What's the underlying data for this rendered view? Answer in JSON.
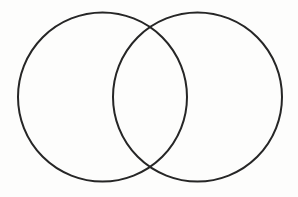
{
  "figure": {
    "kind": "venn-diagram",
    "caption": "",
    "background_color": "#fdfdfc",
    "canvas": {
      "width": 298,
      "height": 197
    },
    "stroke": {
      "color": "#262626",
      "width": 2
    },
    "circles": [
      {
        "name": "left-circle",
        "label": "",
        "cx": 102.5,
        "cy": 97,
        "r": 84.5
      },
      {
        "name": "right-circle",
        "label": "",
        "cx": 197.5,
        "cy": 97,
        "r": 84.5
      }
    ],
    "regions": {
      "left_only_label": "",
      "intersection_label": "",
      "right_only_label": ""
    },
    "intersection_points": [
      {
        "x": 150,
        "y": 28
      },
      {
        "x": 150,
        "y": 166
      }
    ]
  }
}
